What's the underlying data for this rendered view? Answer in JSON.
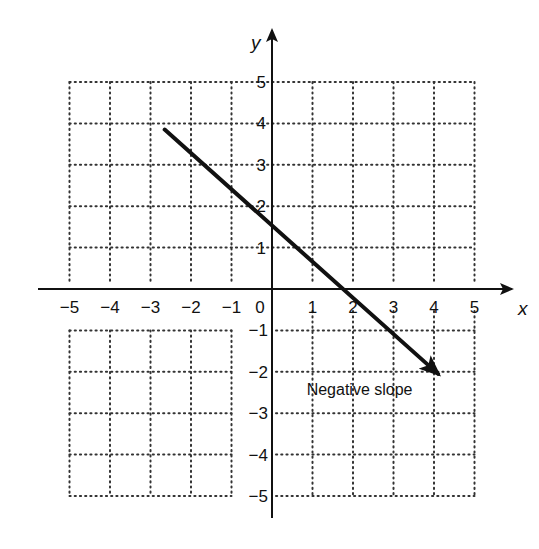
{
  "chart_data": {
    "type": "line",
    "title": "",
    "xlabel": "x",
    "ylabel": "y",
    "xlim": [
      -5,
      5
    ],
    "ylim": [
      -5,
      5
    ],
    "grid": true,
    "grid_style": "dotted",
    "x_ticks": [
      "−5",
      "−4",
      "−3",
      "−2",
      "−1",
      "0",
      "1",
      "2",
      "3",
      "4",
      "5"
    ],
    "y_ticks_positive": [
      "1",
      "2",
      "3",
      "4",
      "5"
    ],
    "y_ticks_negative": [
      "−1",
      "−2",
      "−3",
      "−4",
      "−5"
    ],
    "series": [
      {
        "name": "Negative slope",
        "style": "solid arrow",
        "points": [
          {
            "x": -2.65,
            "y": 3.85
          },
          {
            "x": 0,
            "y": 1.55
          },
          {
            "x": 1.9,
            "y": 0
          },
          {
            "x": 4.1,
            "y": -2.05
          }
        ],
        "slope_sign": "negative"
      }
    ],
    "annotations": [
      {
        "text": "Negative slope",
        "x": 1.3,
        "y": -2.5
      }
    ]
  },
  "labels": {
    "x_axis": "x",
    "y_axis": "y",
    "annotation": "Negative slope"
  },
  "colors": {
    "line": "#111111",
    "grid": "#333333",
    "axis": "#111111"
  }
}
